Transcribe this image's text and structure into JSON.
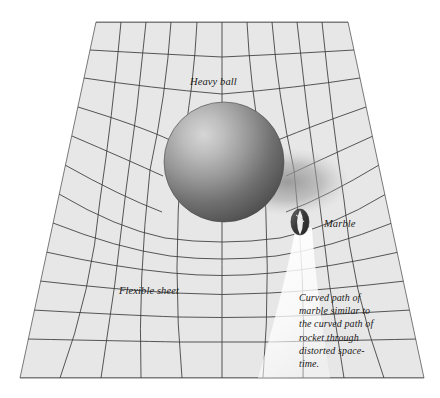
{
  "figure": {
    "background_color": "#ffffff"
  },
  "sheet": {
    "name": "flexible-sheet",
    "fill_color": "#e7e7e7",
    "grid_line_color": "#3a3a3a",
    "edge_color": "#555555",
    "columns": 10,
    "rows": 13,
    "corners": {
      "top_left": [
        96,
        22
      ],
      "top_right": [
        348,
        22
      ],
      "bottom_right": [
        424,
        378
      ],
      "bottom_left": [
        20,
        378
      ]
    }
  },
  "ball": {
    "name": "heavy-ball",
    "center": [
      224,
      162
    ],
    "radius": 60,
    "highlight_color": "#c9c9c9",
    "mid_color": "#8d8d8d",
    "shade_color": "#4e4e4e"
  },
  "shadow": {
    "name": "ball-shadow",
    "color": "#9a9a9a"
  },
  "marble": {
    "name": "marble",
    "center": [
      300,
      222
    ],
    "radius_x": 9,
    "radius_y": 13,
    "dark_color": "#3d3d3d",
    "light_color": "#efefef"
  },
  "path_beam": {
    "name": "marble-curved-path",
    "color": "#ffffff"
  },
  "labels": {
    "heavy_ball": "Heavy ball",
    "marble": "Marble",
    "flexible_sheet": "Flexible sheet"
  },
  "caption": {
    "name": "curved-path-caption",
    "lines": [
      "Curved path of",
      "marble similar to",
      "the curved path of",
      "rocket through",
      "distorted space-",
      "time."
    ],
    "full_text": "Curved path of marble similar to the curved path of rocket through distorted space-time."
  }
}
